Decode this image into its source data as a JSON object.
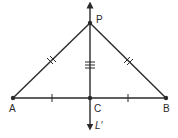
{
  "diagram": {
    "title": "",
    "colors": {
      "line": "#2a2a2a",
      "background": "#ffffff"
    },
    "points": {
      "P": {
        "label": "P",
        "x": 90,
        "y": 23
      },
      "A": {
        "label": "A",
        "x": 13,
        "y": 98
      },
      "B": {
        "label": "B",
        "x": 166,
        "y": 98
      },
      "C": {
        "label": "C",
        "x": 90,
        "y": 98
      }
    },
    "line_label": "L′",
    "segments": [
      {
        "from": "P",
        "to": "A",
        "ticks": 2
      },
      {
        "from": "P",
        "to": "B",
        "ticks": 2
      },
      {
        "from": "P",
        "to": "C",
        "ticks": 3
      },
      {
        "from": "A",
        "to": "C",
        "ticks": 1
      },
      {
        "from": "C",
        "to": "B",
        "ticks": 1
      }
    ],
    "perpendicular_line": {
      "name": "L′",
      "through": [
        "P",
        "C"
      ],
      "arrows": "both"
    }
  }
}
